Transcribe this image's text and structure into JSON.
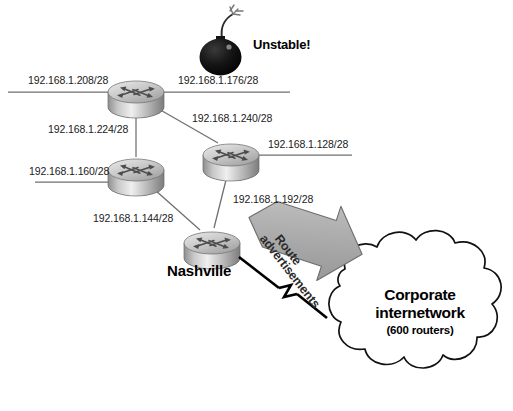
{
  "diagram": {
    "background_color": "#ffffff",
    "line_color": "#6b6b6b",
    "arrow_fill": "#b3b3b3",
    "arrow_stroke": "#555555",
    "cloud_stroke": "#1a1a1a",
    "bomb_color": "#111111"
  },
  "annotations": {
    "unstable": "Unstable!",
    "nashville": "Nashville",
    "route_advertisements_line1": "Route",
    "route_advertisements_line2": "advertisements"
  },
  "cloud": {
    "title_line1": "Corporate",
    "title_line2": "internetwork",
    "subtitle": "(600 routers)"
  },
  "subnets": [
    {
      "id": "subnet-208",
      "label": "192.168.1.208/28"
    },
    {
      "id": "subnet-176",
      "label": "192.168.1.176/28"
    },
    {
      "id": "subnet-224",
      "label": "192.168.1.224/28"
    },
    {
      "id": "subnet-240",
      "label": "192.168.1.240/28"
    },
    {
      "id": "subnet-160",
      "label": "192.168.1.160/28"
    },
    {
      "id": "subnet-128",
      "label": "192.168.1.128/28"
    },
    {
      "id": "subnet-144",
      "label": "192.168.1.144/28"
    },
    {
      "id": "subnet-192",
      "label": "192.168.1.192/28"
    }
  ],
  "routers": [
    {
      "id": "router-top-left",
      "name": "top-left-router"
    },
    {
      "id": "router-mid-left",
      "name": "mid-left-router"
    },
    {
      "id": "router-mid-right",
      "name": "mid-right-router"
    },
    {
      "id": "router-nashville",
      "name": "nashville-router"
    }
  ]
}
